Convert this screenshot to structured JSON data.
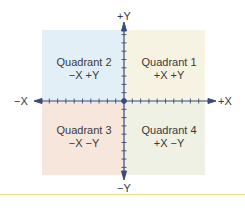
{
  "diagram": {
    "type": "cartesian-quadrants",
    "axes": {
      "x_positive_label": "+X",
      "x_negative_label": "−X",
      "y_positive_label": "+Y",
      "y_negative_label": "−Y",
      "color": "#3b4a78"
    },
    "quadrants": [
      {
        "id": 1,
        "title": "Quadrant 1",
        "signs": "+X +Y",
        "color": "#f7f3e2"
      },
      {
        "id": 2,
        "title": "Quadrant 2",
        "signs": "−X +Y",
        "color": "#e3eff6"
      },
      {
        "id": 3,
        "title": "Quadrant 3",
        "signs": "−X −Y",
        "color": "#f6e6dc"
      },
      {
        "id": 4,
        "title": "Quadrant 4",
        "signs": "+X −Y",
        "color": "#eef1e4"
      }
    ],
    "rule_color": "#f1dc8c"
  }
}
